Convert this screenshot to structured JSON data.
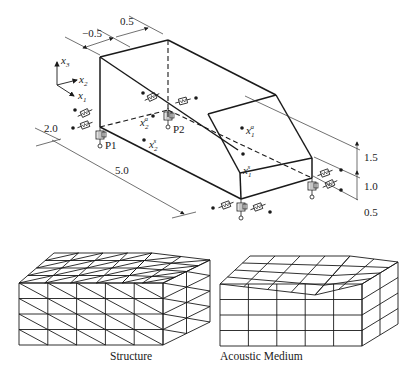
{
  "figure": {
    "top": {
      "title": "Passenger compartment model with mounts",
      "axes": {
        "x3": "x",
        "x3_sub": "3",
        "x2": "x",
        "x2_sub": "2",
        "x1": "x",
        "x1_sub": "1"
      },
      "dimensions": {
        "neg_offset": "−0.5",
        "pos_offset": "0.5",
        "width": "2.0",
        "length": "5.0",
        "height_upper": "1.5",
        "height_middle": "1.0",
        "height_lower": "0.5"
      },
      "points": {
        "p1": "P1",
        "p2": "P2",
        "x1a": {
          "base": "x",
          "sub": "1",
          "sup": "a"
        },
        "x1s": {
          "base": "x",
          "sub": "1",
          "sup": "s"
        },
        "x2a": {
          "base": "x",
          "sub": "2",
          "sup": "a"
        },
        "x2s": {
          "base": "x",
          "sub": "2",
          "sup": "s"
        }
      },
      "mounts": [
        "front-left",
        "rear-left",
        "front-right",
        "rear-right"
      ]
    },
    "bottom": {
      "structure_caption": "Structure",
      "acoustic_caption": "Acoustic Medium",
      "structure_mesh": {
        "element_type": "triangular shell",
        "flat_bays": 5,
        "layers": 4
      },
      "acoustic_mesh": {
        "element_type": "hexahedral",
        "flat_bays": 4,
        "sloped_bays": 2,
        "layers": 4
      }
    }
  },
  "colors": {
    "line": "#1a1a1a",
    "thin": "#333333",
    "background": "#ffffff"
  }
}
